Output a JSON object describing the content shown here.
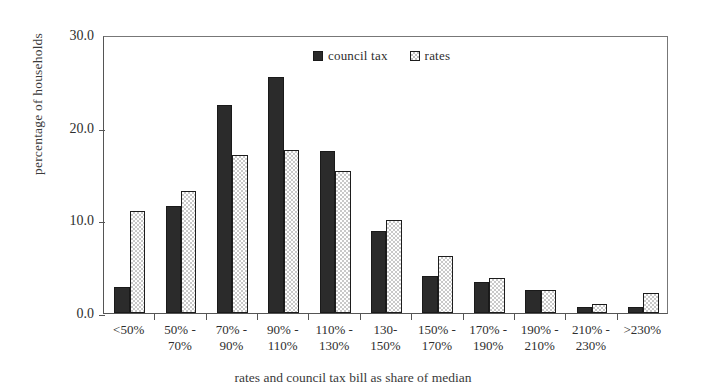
{
  "chart_data": {
    "type": "bar",
    "title": "",
    "xlabel": "rates and council tax bill as share of median",
    "ylabel": "percentage of households",
    "ylim": [
      0,
      30
    ],
    "yticks": [
      0.0,
      10.0,
      20.0,
      30.0
    ],
    "ytick_labels": [
      "0.0",
      "10.0",
      "20.0",
      "30.0"
    ],
    "grid": false,
    "legend_position": "top-center",
    "categories": [
      "<50%",
      "50% - 70%",
      "70% - 90%",
      "90% - 110%",
      "110% - 130%",
      "130-150%",
      "150% - 170%",
      "170% - 190%",
      "190% - 210%",
      "210% - 230%",
      ">230%"
    ],
    "category_lines": [
      [
        "<50%",
        ""
      ],
      [
        "50% -",
        "70%"
      ],
      [
        "70% -",
        "90%"
      ],
      [
        "90% -",
        "110%"
      ],
      [
        "110% -",
        "130%"
      ],
      [
        "130-",
        "150%"
      ],
      [
        "150% -",
        "170%"
      ],
      [
        "170% -",
        "190%"
      ],
      [
        "190% -",
        "210%"
      ],
      [
        "210% -",
        "230%"
      ],
      [
        ">230%",
        ""
      ]
    ],
    "series": [
      {
        "name": "council tax",
        "color": "#2b2b2b",
        "fill": "solid-dark",
        "values": [
          2.8,
          11.6,
          22.5,
          25.5,
          17.5,
          8.8,
          4.0,
          3.4,
          2.5,
          0.6,
          0.6
        ]
      },
      {
        "name": "rates",
        "color": "#ffffff",
        "fill": "checkered-light",
        "values": [
          11.0,
          13.2,
          17.1,
          17.6,
          15.3,
          10.0,
          6.2,
          3.8,
          2.5,
          1.0,
          2.2
        ]
      }
    ]
  },
  "legend": {
    "entries": [
      {
        "label": "council tax",
        "swatch": "dark-square-icon"
      },
      {
        "label": "rates",
        "swatch": "checkered-square-icon"
      }
    ]
  }
}
